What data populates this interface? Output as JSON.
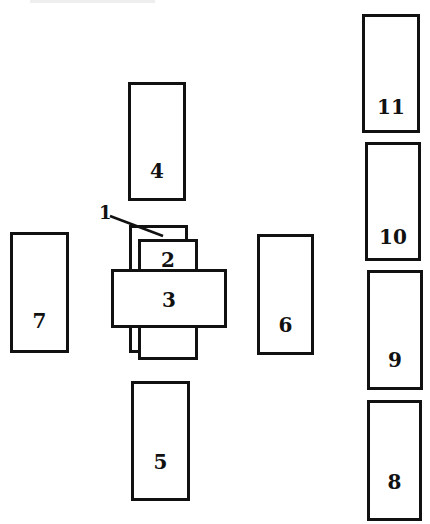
{
  "diagram": {
    "type": "block-layout",
    "stroke_color": "#111111",
    "background_color": "#ffffff",
    "components": [
      {
        "id": "1",
        "label": "1",
        "role": "back plate with leader line"
      },
      {
        "id": "2",
        "label": "2",
        "role": "small block above 3"
      },
      {
        "id": "3",
        "label": "3",
        "role": "central wide block"
      },
      {
        "id": "4",
        "label": "4",
        "role": "block above center"
      },
      {
        "id": "5",
        "label": "5",
        "role": "block below center"
      },
      {
        "id": "6",
        "label": "6",
        "role": "block right of center"
      },
      {
        "id": "7",
        "label": "7",
        "role": "block left of center"
      },
      {
        "id": "8",
        "label": "8",
        "role": "right column bottom"
      },
      {
        "id": "9",
        "label": "9",
        "role": "right column"
      },
      {
        "id": "10",
        "label": "10",
        "role": "right column"
      },
      {
        "id": "11",
        "label": "11",
        "role": "right column top"
      }
    ]
  },
  "labels": {
    "l1": "1",
    "l2": "2",
    "l3": "3",
    "l4": "4",
    "l5": "5",
    "l6": "6",
    "l7": "7",
    "l8": "8",
    "l9": "9",
    "l10": "10",
    "l11": "11"
  }
}
